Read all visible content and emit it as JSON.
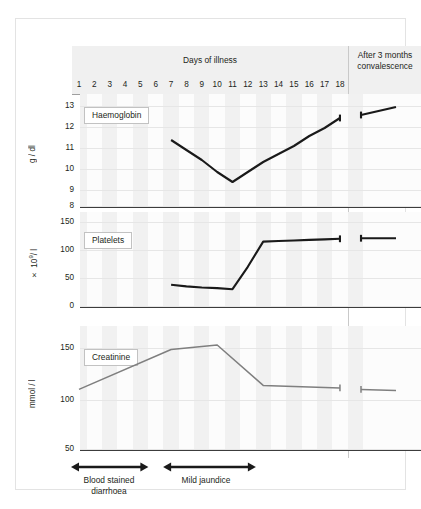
{
  "header": {
    "days_label": "Days of illness",
    "convalescence_label": "After 3 months convalescence",
    "convalescence_line1": "After 3 months",
    "convalescence_line2": "convalescence",
    "day_numbers": [
      "1",
      "2",
      "3",
      "4",
      "5",
      "6",
      "7",
      "8",
      "9",
      "10",
      "11",
      "12",
      "13",
      "14",
      "15",
      "16",
      "17",
      "18"
    ]
  },
  "panels": {
    "haemoglobin": {
      "legend": "Haemoglobin",
      "axis_title": "g / dl",
      "ticks": [
        "13",
        "12",
        "11",
        "10",
        "9",
        "8"
      ]
    },
    "platelets": {
      "legend": "Platelets",
      "axis_title_prefix": "× 10",
      "axis_title_sup": "9",
      "axis_title_suffix": "/ l",
      "ticks": [
        "150",
        "100",
        "50",
        "0"
      ]
    },
    "creatinine": {
      "legend": "Creatinine",
      "axis_title": "mmol / l",
      "ticks": [
        "150",
        "100",
        "50"
      ]
    }
  },
  "annotations": {
    "bar1_line1": "Blood stained",
    "bar1_line2": "diarrhoea",
    "bar2_line1": "Mild jaundice"
  },
  "colors": {
    "line_dark": "#1a1a1a",
    "line_gray": "#7f7f7f",
    "header_band": "#f0f0f0",
    "stripe": "#efefef",
    "frame_border": "#e3e3e3"
  },
  "chart_data": {
    "type": "line",
    "xlabel": "Days of illness",
    "x": [
      1,
      2,
      3,
      4,
      5,
      6,
      7,
      8,
      9,
      10,
      11,
      12,
      13,
      14,
      15,
      16,
      17,
      18
    ],
    "convalescence_x_label": "After 3 months convalescence",
    "grid": true,
    "legend": "inline-boxed",
    "panels": [
      {
        "name": "Haemoglobin",
        "ylabel": "g / dl",
        "ylim": [
          8,
          13
        ],
        "yticks": [
          8,
          9,
          10,
          11,
          12,
          13
        ],
        "color": "#1a1a1a",
        "series": [
          {
            "name": "Haemoglobin",
            "x": [
              7,
              8,
              9,
              10,
              11,
              12,
              13,
              14,
              15,
              16,
              17,
              18
            ],
            "values": [
              11.3,
              10.8,
              10.3,
              9.7,
              9.2,
              9.7,
              10.2,
              10.6,
              11.0,
              11.5,
              11.9,
              12.4
            ]
          },
          {
            "name": "Haemoglobin convalescence",
            "x_label": "After 3 months convalescence",
            "values": [
              12.55,
              12.95
            ],
            "break_before": true
          }
        ]
      },
      {
        "name": "Platelets",
        "ylabel": "× 10⁹ / l",
        "ylim": [
          0,
          150
        ],
        "yticks": [
          0,
          50,
          100,
          150
        ],
        "color": "#1a1a1a",
        "series": [
          {
            "name": "Platelets",
            "x": [
              7,
              8,
              9,
              10,
              11,
              12,
              13,
              14,
              15,
              16,
              17,
              18
            ],
            "values": [
              38,
              35,
              33,
              32,
              30,
              70,
              115,
              116,
              117,
              118,
              119,
              120
            ]
          },
          {
            "name": "Platelets convalescence",
            "x_label": "After 3 months convalescence",
            "values": [
              121,
              121
            ],
            "break_before": true
          }
        ]
      },
      {
        "name": "Creatinine",
        "ylabel": "mmol / l",
        "ylim": [
          50,
          150
        ],
        "yticks": [
          50,
          100,
          150
        ],
        "color": "#7f7f7f",
        "note": "peak exceeds the 150 gridline",
        "series": [
          {
            "name": "Creatinine",
            "x": [
              1,
              7,
              10,
              13,
              14,
              15,
              16,
              17,
              18
            ],
            "values": [
              68,
              147,
              156,
              76,
              75,
              74,
              73,
              72,
              71
            ]
          },
          {
            "name": "Creatinine convalescence",
            "x_label": "After 3 months convalescence",
            "values": [
              68,
              66
            ],
            "break_before": true
          }
        ]
      }
    ],
    "annotations": [
      {
        "label": "Blood stained diarrhoea",
        "from_day": 1,
        "to_day": 5,
        "style": "double-arrow"
      },
      {
        "label": "Mild jaundice",
        "from_day": 7,
        "to_day": 12,
        "style": "double-arrow"
      }
    ]
  }
}
